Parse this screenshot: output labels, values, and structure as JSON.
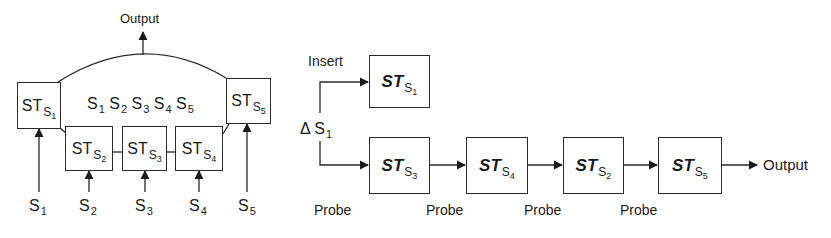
{
  "left_diagram": {
    "output_label": "Output",
    "center_sequence": [
      {
        "base": "S",
        "sub": "1"
      },
      {
        "base": "S",
        "sub": "2"
      },
      {
        "base": "S",
        "sub": "3"
      },
      {
        "base": "S",
        "sub": "4"
      },
      {
        "base": "S",
        "sub": "5"
      }
    ],
    "boxes": [
      {
        "id": "st-s1",
        "main": "ST",
        "sub": "S",
        "sub2": "1"
      },
      {
        "id": "st-s2",
        "main": "ST",
        "sub": "S",
        "sub2": "2"
      },
      {
        "id": "st-s3",
        "main": "ST",
        "sub": "S",
        "sub2": "3"
      },
      {
        "id": "st-s4",
        "main": "ST",
        "sub": "S",
        "sub2": "4"
      },
      {
        "id": "st-s5",
        "main": "ST",
        "sub": "S",
        "sub2": "5"
      }
    ],
    "inputs": [
      {
        "base": "S",
        "sub": "1"
      },
      {
        "base": "S",
        "sub": "2"
      },
      {
        "base": "S",
        "sub": "3"
      },
      {
        "base": "S",
        "sub": "4"
      },
      {
        "base": "S",
        "sub": "5"
      }
    ]
  },
  "right_diagram": {
    "insert_label": "Insert",
    "delta_label": {
      "prefix": "Δ ",
      "base": "S",
      "sub": "1"
    },
    "insert_box": {
      "main": "ST",
      "sub": "S",
      "sub2": "1"
    },
    "chain": [
      {
        "main": "ST",
        "sub": "S",
        "sub2": "3"
      },
      {
        "main": "ST",
        "sub": "S",
        "sub2": "4"
      },
      {
        "main": "ST",
        "sub": "S",
        "sub2": "2"
      },
      {
        "main": "ST",
        "sub": "S",
        "sub2": "5"
      }
    ],
    "probe_labels": [
      "Probe",
      "Probe",
      "Probe",
      "Probe"
    ],
    "output_label": "Output"
  }
}
